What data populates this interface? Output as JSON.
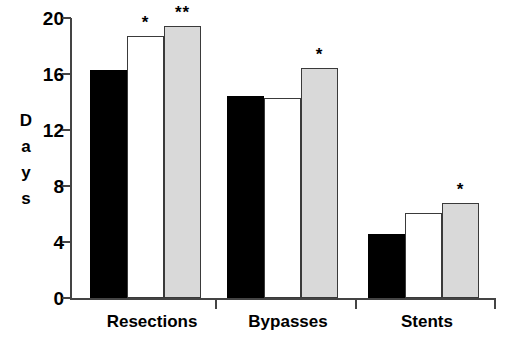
{
  "chart_data": {
    "type": "bar",
    "title": "",
    "xlabel": "",
    "ylabel": "Days",
    "ylim": [
      0,
      20
    ],
    "yticks": [
      0,
      4,
      8,
      12,
      16,
      20
    ],
    "grid": false,
    "legend": "none",
    "categories": [
      "Resections",
      "Bypasses",
      "Stents"
    ],
    "series": [
      {
        "name": "black",
        "color": "#000000",
        "values": [
          16.3,
          14.4,
          4.6
        ]
      },
      {
        "name": "white",
        "color": "#ffffff",
        "values": [
          18.7,
          14.3,
          6.1
        ]
      },
      {
        "name": "gray",
        "color": "#d9d9d9",
        "values": [
          19.4,
          16.4,
          6.8
        ]
      }
    ],
    "annotations": [
      {
        "category": "Resections",
        "series": "white",
        "text": "*"
      },
      {
        "category": "Resections",
        "series": "gray",
        "text": "**"
      },
      {
        "category": "Bypasses",
        "series": "gray",
        "text": "*"
      },
      {
        "category": "Stents",
        "series": "gray",
        "text": "*"
      }
    ]
  },
  "axis": {
    "y_title_letters": [
      "D",
      "a",
      "y",
      "s"
    ],
    "y_tick_labels": [
      "20",
      "16",
      "12",
      "8",
      "4",
      "0"
    ],
    "x_tick_labels": [
      "Resections",
      "Bypasses",
      "Stents"
    ]
  }
}
